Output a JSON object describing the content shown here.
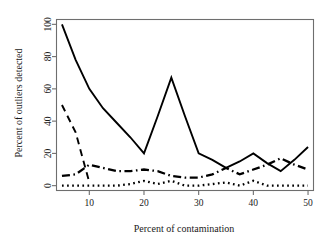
{
  "chart_data": {
    "type": "line",
    "title": "",
    "xlabel": "Percent of contamination",
    "ylabel": "Percent of outliers detected",
    "xlim": [
      4,
      51
    ],
    "ylim": [
      -3,
      103
    ],
    "xticks": [
      10,
      20,
      30,
      40,
      50
    ],
    "xtick_labels": [
      "10",
      "20",
      "30",
      "40",
      "50"
    ],
    "yticks": [
      0,
      20,
      40,
      60,
      80,
      100
    ],
    "ytick_labels": [
      "0",
      "20",
      "40",
      "60",
      "80",
      "100"
    ],
    "grid": false,
    "legend": "none",
    "x": [
      5,
      7.5,
      10,
      12.5,
      15,
      17.5,
      20,
      22.5,
      25,
      27.5,
      30,
      32.5,
      35,
      37.5,
      40,
      42.5,
      45,
      47.5,
      50
    ],
    "series": [
      {
        "name": "solid",
        "style": "solid",
        "values": [
          100,
          78,
          60,
          48,
          39,
          30,
          20,
          43,
          67,
          43,
          20,
          16,
          11,
          15,
          20,
          14,
          9,
          16,
          24
        ]
      },
      {
        "name": "dashed",
        "style": "dashed",
        "values": [
          50,
          33,
          2,
          null,
          null,
          null,
          null,
          null,
          null,
          null,
          null,
          null,
          null,
          null,
          null,
          null,
          null,
          null,
          null
        ]
      },
      {
        "name": "dash-dot",
        "style": "dash-dot",
        "values": [
          6,
          7,
          13,
          11,
          9,
          9,
          10,
          9,
          6,
          5,
          5,
          7,
          11,
          7,
          10,
          13,
          17,
          13,
          10
        ]
      },
      {
        "name": "dotted",
        "style": "dotted",
        "values": [
          0,
          0,
          0,
          0,
          0,
          1,
          3,
          1,
          3,
          0,
          0,
          1,
          2,
          0,
          3,
          0,
          0,
          0,
          0
        ]
      }
    ]
  },
  "axes": {
    "x_label": "Percent of contamination",
    "y_label": "Percent of outliers detected"
  },
  "colors": {
    "ink": "#000000",
    "frame": "#6e6e6e",
    "background": "#ffffff"
  }
}
